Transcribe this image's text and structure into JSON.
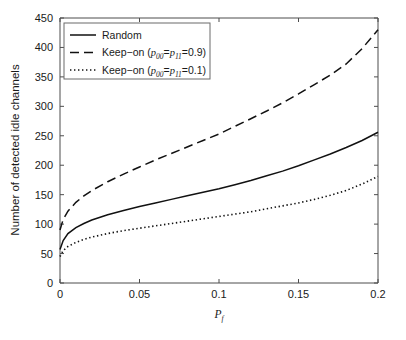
{
  "chart_data": {
    "type": "line",
    "title": "",
    "xlabel": "P_f",
    "xlabel_base": "P",
    "xlabel_sub": "f",
    "ylabel": "Number of detected idle channels",
    "xlim": [
      0,
      0.2
    ],
    "ylim": [
      0,
      450
    ],
    "xticks": [
      0,
      0.05,
      0.1,
      0.15,
      0.2
    ],
    "xtick_labels": [
      "0",
      "0.05",
      "0.1",
      "0.15",
      "0.2"
    ],
    "yticks": [
      0,
      50,
      100,
      150,
      200,
      250,
      300,
      350,
      400,
      450
    ],
    "ytick_labels": [
      "0",
      "50",
      "100",
      "150",
      "200",
      "250",
      "300",
      "350",
      "400",
      "450"
    ],
    "grid": false,
    "legend_position": "upper left",
    "x": [
      0,
      0.002,
      0.005,
      0.01,
      0.015,
      0.02,
      0.03,
      0.04,
      0.05,
      0.06,
      0.07,
      0.08,
      0.09,
      0.1,
      0.11,
      0.12,
      0.13,
      0.14,
      0.15,
      0.16,
      0.17,
      0.18,
      0.19,
      0.2
    ],
    "series": [
      {
        "name": "Random",
        "style": "solid",
        "color": "#111111",
        "values": [
          57,
          72,
          84,
          94,
          101,
          107,
          116,
          123,
          130,
          136,
          142,
          148,
          154,
          160,
          167,
          174,
          182,
          190,
          199,
          209,
          219,
          230,
          242,
          256
        ]
      },
      {
        "name": "Keep-on (p00=p11=0.9)",
        "style": "dashed",
        "color": "#111111",
        "values": [
          90,
          108,
          122,
          137,
          148,
          157,
          172,
          185,
          197,
          209,
          220,
          231,
          242,
          253,
          266,
          279,
          292,
          306,
          321,
          337,
          353,
          372,
          398,
          430
        ]
      },
      {
        "name": "Keep-on (p00=p11=0.1)",
        "style": "dotted",
        "color": "#111111",
        "values": [
          45,
          55,
          62,
          69,
          74,
          78,
          84,
          89,
          93,
          97,
          101,
          105,
          109,
          113,
          117,
          121,
          126,
          131,
          136,
          142,
          149,
          157,
          168,
          181
        ]
      }
    ],
    "legend": [
      {
        "label": "Random",
        "style": "solid",
        "has_math": false,
        "prefix": "Random",
        "sub1": "",
        "mid": "",
        "sub2": "",
        "suffix": ""
      },
      {
        "label": "Keep-on (p00=p11=0.9)",
        "style": "dashed",
        "has_math": true,
        "prefix": "Keep−on (",
        "var1": "p",
        "sub1": "00",
        "mid": "=",
        "var2": "p",
        "sub2": "11",
        "suffix": "=0.9)"
      },
      {
        "label": "Keep-on (p00=p11=0.1)",
        "style": "dotted",
        "has_math": true,
        "prefix": "Keep−on (",
        "var1": "p",
        "sub1": "00",
        "mid": "=",
        "var2": "p",
        "sub2": "11",
        "suffix": "=0.1)"
      }
    ],
    "colors": {
      "axis": "#4d4d4d",
      "curve": "#111111",
      "legend_border": "#6b6b6b",
      "background": "#ffffff"
    }
  }
}
